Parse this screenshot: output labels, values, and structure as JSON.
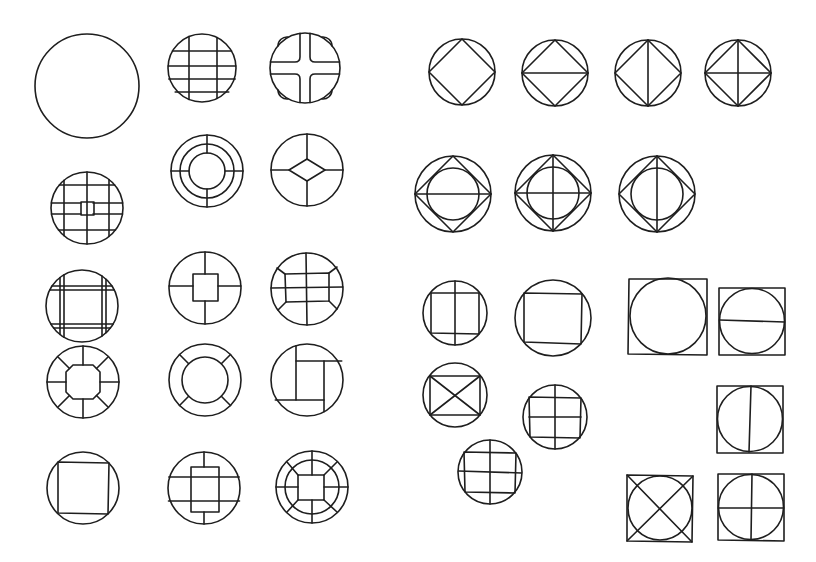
{
  "figure": {
    "caption_fragment": "",
    "stroke_color": "#1e1e1e",
    "background": "#ffffff"
  },
  "left_group": {
    "label": "circle lattice patterns",
    "items": [
      {
        "id": "L1",
        "desc": "plain circle",
        "cx": 87,
        "cy": 86,
        "r": 52
      },
      {
        "id": "L2",
        "desc": "circle with grid: 2 vertical, 4 horizontal lines",
        "cx": 202,
        "cy": 68,
        "r": 34
      },
      {
        "id": "L3",
        "desc": "circle with cross band and quarter-arc corners",
        "cx": 305,
        "cy": 68,
        "r": 35
      },
      {
        "id": "L4",
        "desc": "circle grid with small center square",
        "cx": 87,
        "cy": 208,
        "r": 36
      },
      {
        "id": "L5",
        "desc": "three concentric rings with radial spokes",
        "cx": 207,
        "cy": 171,
        "r": 36
      },
      {
        "id": "L6",
        "desc": "circle with center diamond and 4 spokes",
        "cx": 307,
        "cy": 170,
        "r": 36
      },
      {
        "id": "L7",
        "desc": "circle with double-line square frame",
        "cx": 82,
        "cy": 306,
        "r": 36
      },
      {
        "id": "L8",
        "desc": "circle with center square and 4 spokes",
        "cx": 205,
        "cy": 288,
        "r": 36
      },
      {
        "id": "L9",
        "desc": "circle with center rectangle, cross and corner diagonals",
        "cx": 307,
        "cy": 289,
        "r": 36
      },
      {
        "id": "L10",
        "desc": "circle with center octagon and 8 spokes",
        "cx": 83,
        "cy": 382,
        "r": 36
      },
      {
        "id": "L11",
        "desc": "ring with 4 diagonal spokes",
        "cx": 205,
        "cy": 380,
        "r": 36
      },
      {
        "id": "L12",
        "desc": "circle with pinwheel square",
        "cx": 307,
        "cy": 380,
        "r": 36
      },
      {
        "id": "L13",
        "desc": "circle with inscribed square",
        "cx": 83,
        "cy": 488,
        "r": 36
      },
      {
        "id": "L14",
        "desc": "circle with center rectangle, 2 horizontal bands and vertical spokes",
        "cx": 204,
        "cy": 488,
        "r": 36
      },
      {
        "id": "L15",
        "desc": "double ring with center square and 8 spokes",
        "cx": 312,
        "cy": 487,
        "r": 36
      }
    ]
  },
  "right_group": {
    "label": "geometric construction patterns",
    "items": [
      {
        "id": "R1",
        "desc": "circle with inscribed diamond",
        "cx": 462,
        "cy": 72,
        "r": 33
      },
      {
        "id": "R2",
        "desc": "circle with inscribed diamond and horizontal diagonal",
        "cx": 555,
        "cy": 73,
        "r": 33
      },
      {
        "id": "R3",
        "desc": "circle with inscribed diamond and vertical diagonal",
        "cx": 648,
        "cy": 73,
        "r": 33
      },
      {
        "id": "R4",
        "desc": "circle with inscribed diamond and both diagonals",
        "cx": 738,
        "cy": 73,
        "r": 33
      },
      {
        "id": "R5",
        "desc": "circle, diamond, inner circle, horizontal diagonal",
        "cx": 453,
        "cy": 194,
        "r": 38
      },
      {
        "id": "R6",
        "desc": "circle, diamond, inner circle, both diagonals",
        "cx": 553,
        "cy": 193,
        "r": 38
      },
      {
        "id": "R7",
        "desc": "circle, diamond, inner circle, vertical diagonal",
        "cx": 657,
        "cy": 194,
        "r": 38
      },
      {
        "id": "R8",
        "desc": "circle with inscribed square and vertical line",
        "cx": 455,
        "cy": 313,
        "r": 32
      },
      {
        "id": "R9",
        "desc": "circle with inscribed square",
        "cx": 553,
        "cy": 318,
        "r": 38
      },
      {
        "id": "R10",
        "desc": "square with inscribed circle",
        "cx": 668,
        "cy": 316,
        "h": 39
      },
      {
        "id": "R11",
        "desc": "square with inscribed circle and horizontal line",
        "cx": 752,
        "cy": 321,
        "h": 33
      },
      {
        "id": "R12",
        "desc": "circle with inscribed square and X diagonals",
        "cx": 455,
        "cy": 395,
        "r": 32
      },
      {
        "id": "R13",
        "desc": "circle with inscribed square, 1 vertical and 2 horizontal lines",
        "cx": 555,
        "cy": 417,
        "r": 32
      },
      {
        "id": "R14",
        "desc": "square with inscribed circle and vertical line",
        "cx": 750,
        "cy": 419,
        "h": 33
      },
      {
        "id": "R15",
        "desc": "circle with square grid, 1 vertical and 2 horizontal lines",
        "cx": 490,
        "cy": 472,
        "r": 32
      },
      {
        "id": "R16",
        "desc": "square with inscribed circle and X diagonals",
        "cx": 660,
        "cy": 508,
        "h": 33
      },
      {
        "id": "R17",
        "desc": "square with inscribed circle and cross",
        "cx": 751,
        "cy": 507,
        "h": 33
      }
    ]
  }
}
